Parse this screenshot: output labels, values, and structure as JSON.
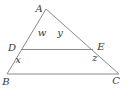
{
  "diagram": {
    "vertices": {
      "A": "A",
      "B": "B",
      "C": "C",
      "D": "D",
      "E": "E"
    },
    "angles": {
      "w": "w",
      "x": "x",
      "y": "y",
      "z": "z"
    },
    "colors": {
      "line": "#8a8a8a",
      "label": "#3a3a3a",
      "background": "#ffffff"
    }
  }
}
